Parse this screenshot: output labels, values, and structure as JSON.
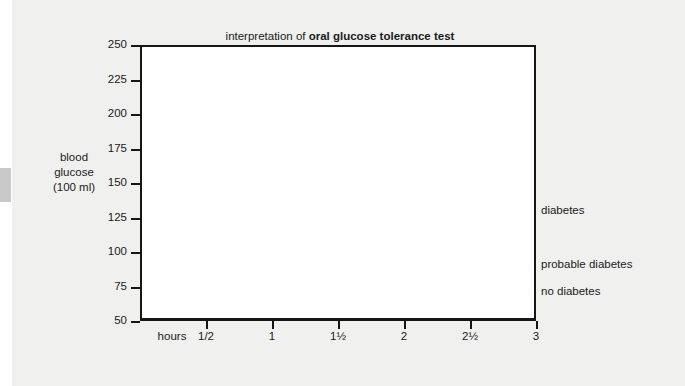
{
  "title": {
    "prefix": "interpretation of ",
    "emphasis": "oral glucose tolerance test"
  },
  "axis_title": {
    "line1": "blood",
    "line2": "glucose",
    "line3": "(100 ml)"
  },
  "colors": {
    "page_background": "#f0f0ee",
    "plot_background": "#ffffff",
    "axis": "#161616",
    "diabetes": "#6b6b6b",
    "probable_diabetes": "#6b6b6b",
    "no_diabetes": "#161616"
  },
  "series_labels": {
    "diabetes": "diabetes",
    "probable_diabetes": "probable diabetes",
    "no_diabetes": "no diabetes"
  },
  "chart_data": {
    "type": "line",
    "title": "interpretation of oral glucose tolerance test",
    "xlabel": "hours",
    "ylabel": "blood glucose (100 ml)",
    "xlim": [
      0,
      3
    ],
    "ylim": [
      50,
      250
    ],
    "ytick_labels": [
      "250",
      "225",
      "200",
      "175",
      "150",
      "125",
      "100",
      "75",
      "50"
    ],
    "ytick_values": [
      250,
      225,
      200,
      175,
      150,
      125,
      100,
      75,
      50
    ],
    "xtick_labels": [
      "hours",
      "1/2",
      "1",
      "1½",
      "2",
      "2½",
      "3"
    ],
    "xtick_values": [
      0,
      0.5,
      1,
      1.5,
      2,
      2.5,
      3
    ],
    "grid": false,
    "legend": "right-inline",
    "x": [
      0,
      0.5,
      1,
      1.5,
      2,
      2.5,
      3
    ],
    "series": [
      {
        "name": "diabetes",
        "color": "#6b6b6b",
        "width": 7,
        "values": [
          105,
          200,
          210,
          168,
          152,
          137,
          131
        ]
      },
      {
        "name": "probable diabetes",
        "color": "#6b6b6b",
        "width": 3.5,
        "values": [
          88,
          165,
          185,
          143,
          123,
          108,
          92
        ]
      },
      {
        "name": "no diabetes",
        "color": "#161616",
        "width": 3,
        "values": [
          72,
          132,
          120,
          85,
          65,
          81,
          73
        ]
      }
    ]
  }
}
